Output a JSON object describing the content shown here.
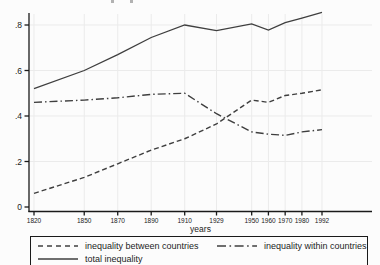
{
  "chart_data": {
    "type": "line",
    "title": "",
    "xlabel": "years",
    "ylabel": "",
    "x": [
      1820,
      1850,
      1870,
      1890,
      1910,
      1929,
      1950,
      1960,
      1970,
      1980,
      1992
    ],
    "x_tick_labels": [
      "1820",
      "1850",
      "1870",
      "1890",
      "1910",
      "1929",
      "1950",
      "1960",
      "1970",
      "1980",
      "1992"
    ],
    "y_ticks": [
      {
        "label": ".8",
        "value": 0.8
      },
      {
        "label": ".6",
        "value": 0.6
      },
      {
        "label": ".4",
        "value": 0.4
      },
      {
        "label": ".2",
        "value": 0.2
      },
      {
        "label": "0",
        "value": 0.0
      }
    ],
    "xlim": [
      1820,
      1992
    ],
    "ylim": [
      0,
      0.88
    ],
    "grid": true,
    "legend_position": "bottom-left-box",
    "series": [
      {
        "name": "inequality between countries",
        "style": "dashed",
        "values": [
          0.06,
          0.13,
          0.19,
          0.25,
          0.3,
          0.365,
          0.47,
          0.46,
          0.49,
          0.5,
          0.515
        ]
      },
      {
        "name": "inequality within countries",
        "style": "dashdot",
        "values": [
          0.46,
          0.47,
          0.48,
          0.495,
          0.5,
          0.41,
          0.33,
          0.32,
          0.315,
          0.33,
          0.34
        ]
      },
      {
        "name": "total inequality",
        "style": "solid",
        "values": [
          0.52,
          0.6,
          0.67,
          0.745,
          0.8,
          0.775,
          0.805,
          0.778,
          0.81,
          0.83,
          0.855
        ]
      }
    ],
    "colors": {
      "line": "#3f3f3f",
      "axis": "#1a1a1a",
      "grid": "#ebebeb",
      "tick_text": "#222222"
    }
  }
}
